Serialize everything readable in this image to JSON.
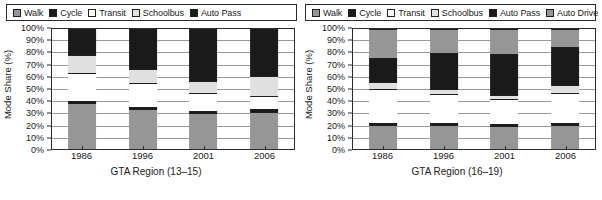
{
  "panels": [
    {
      "name": "left",
      "legend": [
        {
          "label": "Walk",
          "color": "#969696"
        },
        {
          "label": "Cycle",
          "color": "#1a1a1a"
        },
        {
          "label": "Transit",
          "color": "#ffffff"
        },
        {
          "label": "Schoolbus",
          "color": "#e0e0e0"
        },
        {
          "label": "Auto Pass",
          "color": "#1a1a1a"
        }
      ],
      "ylabel": "Mode Share (%)",
      "xlabel": "GTA Region (13–15)",
      "yticks": [
        "0%",
        "10%",
        "20%",
        "30%",
        "40%",
        "50%",
        "60%",
        "70%",
        "80%",
        "90%",
        "100%"
      ],
      "xticks": [
        "1986",
        "1996",
        "2001",
        "2006"
      ]
    },
    {
      "name": "right",
      "legend": [
        {
          "label": "Walk",
          "color": "#969696"
        },
        {
          "label": "Cycle",
          "color": "#1a1a1a"
        },
        {
          "label": "Transit",
          "color": "#ffffff"
        },
        {
          "label": "Schoolbus",
          "color": "#e0e0e0"
        },
        {
          "label": "Auto Pass",
          "color": "#1a1a1a"
        },
        {
          "label": "Auto Drive",
          "color": "#969696"
        }
      ],
      "ylabel": "Mode Share (%)",
      "xlabel": "GTA Region (16–19)",
      "yticks": [
        "0%",
        "10%",
        "20%",
        "30%",
        "40%",
        "50%",
        "60%",
        "70%",
        "80%",
        "90%",
        "100%"
      ],
      "xticks": [
        "1986",
        "1996",
        "2001",
        "2006"
      ]
    }
  ],
  "chart_data": [
    {
      "type": "bar",
      "stacked": true,
      "title": "",
      "xlabel": "GTA Region (13–15)",
      "ylabel": "Mode Share (%)",
      "ylim": [
        0,
        100
      ],
      "ytick_step": 10,
      "grid": true,
      "legend_position": "top",
      "categories": [
        "1986",
        "1996",
        "2001",
        "2006"
      ],
      "series": [
        {
          "name": "Walk",
          "color": "#969696",
          "values": [
            38,
            33,
            30,
            31
          ]
        },
        {
          "name": "Cycle",
          "color": "#1a1a1a",
          "values": [
            2,
            2,
            2,
            2
          ]
        },
        {
          "name": "Transit",
          "color": "#ffffff",
          "values": [
            23,
            20,
            15,
            11
          ]
        },
        {
          "name": "Schoolbus",
          "color": "#e0e0e0",
          "values": [
            15,
            12,
            10,
            17
          ]
        },
        {
          "name": "Auto Pass",
          "color": "#1a1a1a",
          "values": [
            22,
            33,
            43,
            39
          ]
        }
      ]
    },
    {
      "type": "bar",
      "stacked": true,
      "title": "",
      "xlabel": "GTA Region (16–19)",
      "ylabel": "Mode Share (%)",
      "ylim": [
        0,
        100
      ],
      "ytick_step": 10,
      "grid": true,
      "legend_position": "top",
      "categories": [
        "1986",
        "1996",
        "2001",
        "2006"
      ],
      "series": [
        {
          "name": "Walk",
          "color": "#969696",
          "values": [
            20,
            20,
            19,
            20
          ]
        },
        {
          "name": "Cycle",
          "color": "#1a1a1a",
          "values": [
            2,
            2,
            2,
            2
          ]
        },
        {
          "name": "Transit",
          "color": "#ffffff",
          "values": [
            28,
            24,
            21,
            25
          ]
        },
        {
          "name": "Schoolbus",
          "color": "#e0e0e0",
          "values": [
            6,
            4,
            3,
            6
          ]
        },
        {
          "name": "Auto Pass",
          "color": "#1a1a1a",
          "values": [
            20,
            30,
            34,
            32
          ]
        },
        {
          "name": "Auto Drive",
          "color": "#969696",
          "values": [
            24,
            20,
            21,
            15
          ]
        }
      ]
    }
  ]
}
